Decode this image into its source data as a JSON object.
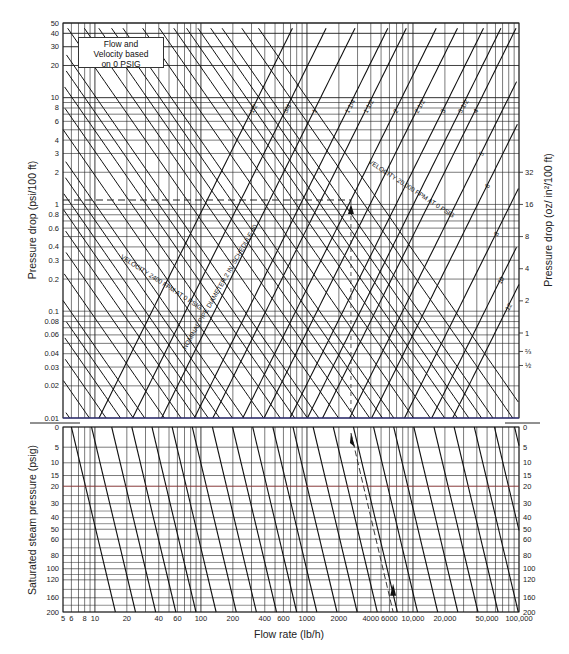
{
  "chart_data": [
    {
      "type": "line",
      "panel": "upper",
      "title": "",
      "note_box": [
        "Flow and",
        "Velocity based",
        "on 0 PSIG"
      ],
      "xlabel": "Flow rate (lb/h)",
      "ylabel": "Pressure drop (psi/100 ft)",
      "ylabel_right": "Pressure drop (oz/ in²/100 ft)",
      "x_scale": "log",
      "y_scale": "log",
      "xlim": [
        5,
        100000
      ],
      "ylim": [
        0.01,
        50
      ],
      "y_ticks": [
        "0.01",
        "0.02",
        "0.03",
        "0.04",
        "0.06",
        "0.08",
        "0.1",
        "0.2",
        "0.3",
        "0.4",
        "0.6",
        "0.8",
        "1",
        "2",
        "3",
        "4",
        "6",
        "8",
        "10",
        "20",
        "30",
        "40",
        "50"
      ],
      "y_ticks_right": [
        "½",
        "⅔",
        "1",
        "2",
        "4",
        "8",
        "16",
        "32"
      ],
      "pipe_diameter_series_label": "NOMINAL PIPE DIAMETER, IN. SCHEDULE 40",
      "pipe_diameters": [
        "1/2",
        "3/4",
        "1",
        "1 1/4",
        "1 1/2",
        "2",
        "2 1/2",
        "3",
        "3 1/2",
        "4",
        "5",
        "6",
        "8",
        "10",
        "12"
      ],
      "velocity_series_label": "VELOCITY, FPM AT 0 PSIG",
      "velocity_lines_fpm": [
        600,
        800,
        1000,
        1200,
        1400,
        1600,
        1800,
        2000,
        2400,
        2800,
        3200,
        3600,
        4000,
        4500,
        5000,
        6000,
        7000,
        8000,
        9000,
        10000,
        12000,
        14000,
        16000,
        18000,
        20000,
        24000,
        28000,
        32000,
        36000,
        40000,
        45000,
        50000,
        60000,
        70000
      ],
      "annotations": {
        "example_pressure_drop_psi": 1.1,
        "example_flow_lb_h": 2600,
        "dashed_guide": "horizontal dashed line at ~1.1 psi/100 ft from left axis to 2 in. pipe line, vertical dashed line down to flow axis"
      },
      "grid": true
    },
    {
      "type": "line",
      "panel": "lower",
      "ylabel": "Saturated steam pressure (psig)",
      "xlabel": "Flow rate (lb/h)",
      "x_scale": "log",
      "xlim": [
        5,
        100000
      ],
      "ylim": [
        0,
        200
      ],
      "y_ticks": [
        "0",
        "5",
        "10",
        "15",
        "20",
        "30",
        "40",
        "50",
        "60",
        "80",
        "100",
        "120",
        "160",
        "200"
      ],
      "x_ticks": [
        "5",
        "6",
        "8",
        "10",
        "20",
        "40",
        "60",
        "100",
        "200",
        "400",
        "600",
        "1000",
        "2000",
        "4000",
        "6000",
        "10,000",
        "20,000",
        "50,000",
        "100,000"
      ],
      "annotations": {
        "example_steam_pressure_psig": 150,
        "example_flow_lb_h": 6500
      },
      "grid": true
    }
  ],
  "labels": {
    "note_line1": "Flow and",
    "note_line2": "Velocity based",
    "note_line3": "on 0 PSIG",
    "xlabel": "Flow rate (lb/h)",
    "ylabel_upper": "Pressure drop (psi/100 ft)",
    "ylabel_right": "Pressure drop (oz/ in²/100 ft)",
    "ylabel_lower": "Saturated steam pressure (psig)",
    "velocity_label": "VELOCITY 2400 FPM AT 0 PSIG",
    "velocity_label_right": "VELOCITY 20,000 FPM AT 0 PSIG",
    "diameter_label": "NOMINAL PIPE DIAMETER 2 IN. SCHEDULE 40"
  }
}
